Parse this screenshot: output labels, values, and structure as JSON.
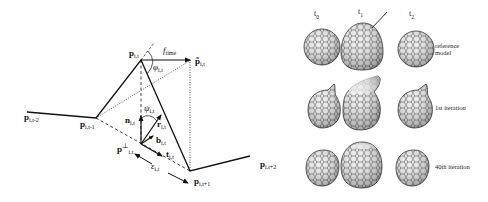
{
  "left_diagram": {
    "points": {
      "p_prev2": {
        "base": "p",
        "sub": "i,t-2"
      },
      "p_prev1": {
        "base": "p",
        "sub": "i,t-1"
      },
      "p_curr": {
        "base": "p",
        "sub": "i,t"
      },
      "p_tilde": {
        "base": "p̃",
        "sub": "i,t"
      },
      "p_perp": {
        "base": "p",
        "sub": "i,t",
        "sup": "⊥"
      },
      "p_next1": {
        "base": "p",
        "sub": "i,t+1"
      },
      "p_next2": {
        "base": "p",
        "sub": "i,t+2"
      }
    },
    "vectors": {
      "f_time": {
        "base": "f",
        "sub": "time"
      },
      "n": {
        "base": "n",
        "sub": "i,t"
      },
      "r": {
        "base": "r",
        "sub": "i,t"
      },
      "b": {
        "base": "b",
        "sub": "i,t"
      },
      "t": {
        "base": "t",
        "sub": "i,t"
      }
    },
    "angles": {
      "phi": {
        "base": "φ",
        "sub": "i,t"
      },
      "psi": {
        "base": "ψ",
        "sub": "i,t"
      },
      "epsilon": {
        "base": "ε",
        "sub": "i,t"
      }
    }
  },
  "right_figure": {
    "columns": [
      {
        "base": "t",
        "sub": "0"
      },
      {
        "base": "t",
        "sub": "1"
      },
      {
        "base": "t",
        "sub": "2"
      }
    ],
    "rows": [
      {
        "label_line1": "reference",
        "label_line2": "model"
      },
      {
        "label_line1": "1st iteration",
        "label_line2": ""
      },
      {
        "label_line1": "40th iteration",
        "label_line2": ""
      }
    ]
  },
  "colors": {
    "line": "#111111",
    "mesh_fill": "#e8e8e8",
    "mesh_line": "#555555"
  }
}
